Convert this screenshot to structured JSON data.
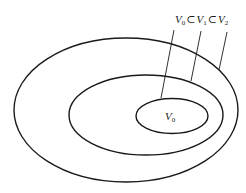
{
  "diagram": {
    "type": "nested-sets",
    "stroke_color": "#1a1a1a",
    "background": "#ffffff",
    "sets": [
      {
        "id": "V2",
        "role": "outer"
      },
      {
        "id": "V1",
        "role": "middle"
      },
      {
        "id": "V0",
        "role": "inner",
        "label": {
          "base": "V",
          "sub": "0"
        }
      }
    ],
    "caption": {
      "text": "V0 ⊂ V1 ⊂ V2",
      "parts": [
        {
          "base": "V",
          "sub": "0"
        },
        {
          "op": "⊂"
        },
        {
          "base": "V",
          "sub": "1"
        },
        {
          "op": "⊂"
        },
        {
          "base": "V",
          "sub": "2"
        }
      ]
    }
  }
}
